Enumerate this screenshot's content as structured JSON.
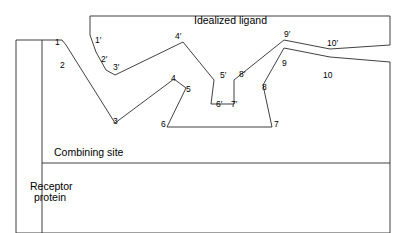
{
  "figure": {
    "title": "Idealized ligand",
    "title_pos": {
      "x": 194,
      "y": 14
    },
    "captions": [
      {
        "name": "combining-site",
        "text": "Combining site",
        "x": 54,
        "y": 146
      },
      {
        "name": "receptor-protein-line1",
        "text": "Receptor",
        "x": 30,
        "y": 180
      },
      {
        "name": "receptor-protein-line2",
        "text": "protein",
        "x": 34,
        "y": 191
      }
    ],
    "colors": {
      "stroke": "#2b2b2b",
      "background": "#ffffff",
      "text": "#000000"
    }
  },
  "ligand": {
    "name": "idealized-ligand",
    "outline_points": "390,16 90,16 90,35 96,52 106,70 115,75 183,42 214,80 211,104 234,104 234,80 284,40 330,49 390,45 390,16",
    "labels": [
      {
        "id": "1p",
        "text": "1′",
        "x": 95,
        "y": 36
      },
      {
        "id": "2p",
        "text": "2′",
        "x": 101,
        "y": 55
      },
      {
        "id": "3p",
        "text": "3′",
        "x": 113,
        "y": 63
      },
      {
        "id": "4p",
        "text": "4′",
        "x": 175,
        "y": 32
      },
      {
        "id": "5p",
        "text": "5′",
        "x": 220,
        "y": 71
      },
      {
        "id": "6p",
        "text": "6′",
        "x": 216,
        "y": 100
      },
      {
        "id": "7p",
        "text": "7′",
        "x": 231,
        "y": 100
      },
      {
        "id": "8p",
        "text": "8′",
        "x": 239,
        "y": 70
      },
      {
        "id": "9p",
        "text": "9′",
        "x": 284,
        "y": 30
      },
      {
        "id": "10p",
        "text": "10′",
        "x": 327,
        "y": 39
      }
    ]
  },
  "receptor": {
    "name": "receptor-protein",
    "outline_points": "16,40 16,233 390,233 390,62 330,57 284,48 263,85 272,127 167,127 186,88 174,79 115,123 66,45 62,40 16,40",
    "inner_vertical": {
      "x": 42,
      "y1": 40,
      "y2": 233
    },
    "combining_site_line": {
      "x1": 42,
      "y1": 163,
      "x2": 390,
      "y2": 163
    },
    "labels": [
      {
        "id": "1",
        "text": "1",
        "x": 55,
        "y": 38
      },
      {
        "id": "2",
        "text": "2",
        "x": 60,
        "y": 61
      },
      {
        "id": "3",
        "text": "3",
        "x": 113,
        "y": 117
      },
      {
        "id": "4",
        "text": "4",
        "x": 171,
        "y": 74
      },
      {
        "id": "5",
        "text": "5",
        "x": 186,
        "y": 85
      },
      {
        "id": "6",
        "text": "6",
        "x": 161,
        "y": 120
      },
      {
        "id": "7",
        "text": "7",
        "x": 274,
        "y": 120
      },
      {
        "id": "8",
        "text": "8",
        "x": 262,
        "y": 83
      },
      {
        "id": "9",
        "text": "9",
        "x": 282,
        "y": 59
      },
      {
        "id": "10",
        "text": "10",
        "x": 323,
        "y": 71
      }
    ]
  }
}
